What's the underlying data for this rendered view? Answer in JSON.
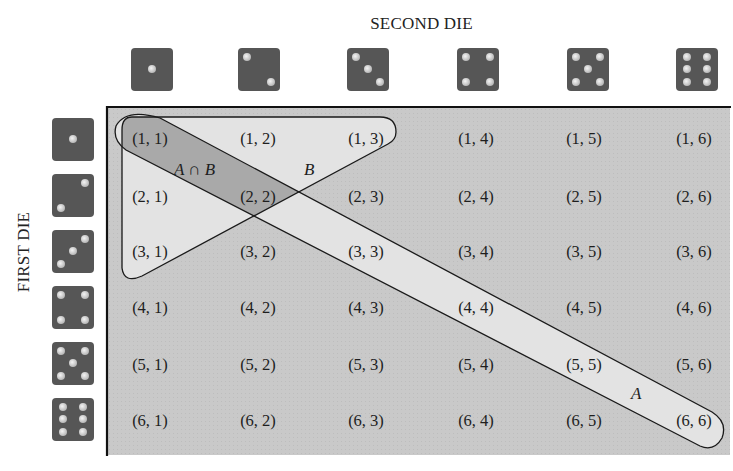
{
  "diagram": {
    "title_top": "SECOND DIE",
    "title_side": "FIRST DIE",
    "set_labels": {
      "intersection": "A ∩ B",
      "B": "B",
      "A": "A"
    },
    "second_die_faces": [
      1,
      2,
      3,
      4,
      5,
      6
    ],
    "first_die_faces": [
      1,
      2,
      3,
      4,
      5,
      6
    ],
    "rows": [
      [
        "(1, 1)",
        "(1, 2)",
        "(1, 3)",
        "(1, 4)",
        "(1, 5)",
        "(1, 6)"
      ],
      [
        "(2, 1)",
        "(2, 2)",
        "(2, 3)",
        "(2, 4)",
        "(2, 5)",
        "(2, 6)"
      ],
      [
        "(3, 1)",
        "(3, 2)",
        "(3, 3)",
        "(3, 4)",
        "(3, 5)",
        "(3, 6)"
      ],
      [
        "(4, 1)",
        "(4, 2)",
        "(4, 3)",
        "(4, 4)",
        "(4, 5)",
        "(4, 6)"
      ],
      [
        "(5, 1)",
        "(5, 2)",
        "(5, 3)",
        "(5, 4)",
        "(5, 5)",
        "(5, 6)"
      ],
      [
        "(6, 1)",
        "(6, 2)",
        "(6, 3)",
        "(6, 4)",
        "(6, 5)",
        "(6, 6)"
      ]
    ],
    "set_A_members": [
      "(1, 1)",
      "(2, 2)",
      "(3, 3)",
      "(4, 4)",
      "(5, 5)",
      "(6, 6)"
    ],
    "set_B_members": [
      "(1, 1)",
      "(1, 2)",
      "(1, 3)",
      "(2, 1)",
      "(2, 2)",
      "(3, 1)"
    ],
    "intersection_members": [
      "(1, 1)",
      "(2, 2)"
    ],
    "colors": {
      "grid_background": "#c9c9c9",
      "set_fill": "#e3e3e3",
      "intersection_fill": "#a9a9a9",
      "die_body": "#565656",
      "outline": "#1a1a1a"
    }
  }
}
